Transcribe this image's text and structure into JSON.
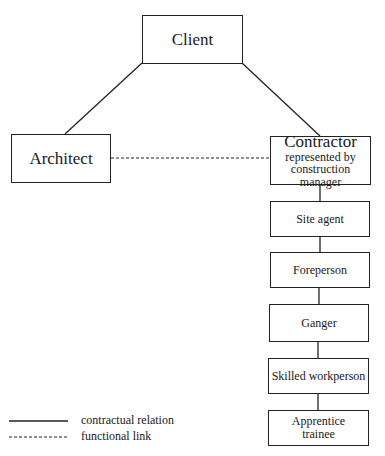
{
  "diagram": {
    "nodes": {
      "client": "Client",
      "architect": "Architect",
      "contractor": "Contractor",
      "contractor_sub": "represented by",
      "contractor_sub2": "construction manager",
      "site_agent": "Site agent",
      "foreperson": "Foreperson",
      "ganger": "Ganger",
      "skilled": "Skilled workperson",
      "apprentice_1": "Apprentice",
      "apprentice_2": "trainee"
    },
    "edges": [
      {
        "from": "client",
        "to": "architect",
        "type": "contractual relation"
      },
      {
        "from": "client",
        "to": "contractor",
        "type": "contractual relation"
      },
      {
        "from": "architect",
        "to": "contractor",
        "type": "functional link"
      },
      {
        "from": "contractor",
        "to": "site_agent",
        "type": "contractual relation"
      },
      {
        "from": "site_agent",
        "to": "foreperson",
        "type": "contractual relation"
      },
      {
        "from": "foreperson",
        "to": "ganger",
        "type": "contractual relation"
      },
      {
        "from": "ganger",
        "to": "skilled",
        "type": "contractual relation"
      },
      {
        "from": "skilled",
        "to": "apprentice",
        "type": "contractual relation"
      }
    ],
    "legend": {
      "solid": "contractual relation",
      "dashed": "functional link"
    }
  }
}
